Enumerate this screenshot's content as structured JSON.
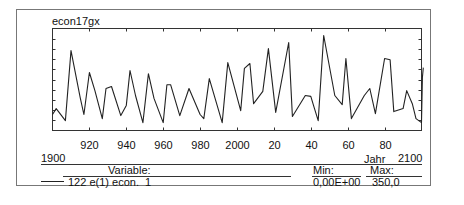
{
  "chart_data": {
    "type": "line",
    "title": "econ17gx",
    "xlabel": "Jahr",
    "ylabel": "",
    "xlim": [
      1900,
      2100
    ],
    "ylim": [
      0,
      350
    ],
    "x_tick_labels": [
      "920",
      "940",
      "960",
      "980",
      "2000",
      "20",
      "40",
      "60",
      "80"
    ],
    "x_ticks": [
      1920,
      1940,
      1960,
      1980,
      2000,
      2020,
      2040,
      2060,
      2080
    ],
    "x_range_labels": {
      "start": "1900",
      "end": "2100",
      "unit": "Jahr"
    },
    "grid": false,
    "series": [
      {
        "name": "122 e(1) econ.  1",
        "x": [
          1900,
          1902,
          1907,
          1910,
          1915,
          1917,
          1920,
          1923,
          1927,
          1929,
          1932,
          1937,
          1940,
          1942,
          1945,
          1949,
          1952,
          1955,
          1960,
          1962,
          1964,
          1969,
          1974,
          1980,
          1982,
          1985,
          1992,
          1995,
          2002,
          2004,
          2007,
          2009,
          2014,
          2017,
          2021,
          2028,
          2030,
          2037,
          2040,
          2042,
          2044,
          2047,
          2053,
          2057,
          2059,
          2062,
          2069,
          2072,
          2075,
          2080,
          2083,
          2085,
          2090,
          2092,
          2095,
          2097,
          2100,
          2100.5,
          2101
        ],
        "values": [
          55,
          75,
          34,
          274,
          113,
          55,
          199,
          137,
          41,
          144,
          151,
          51,
          86,
          206,
          120,
          27,
          195,
          110,
          27,
          157,
          157,
          51,
          144,
          55,
          41,
          178,
          27,
          233,
          68,
          213,
          230,
          92,
          134,
          281,
          62,
          302,
          48,
          120,
          117,
          75,
          34,
          326,
          120,
          89,
          247,
          41,
          120,
          144,
          58,
          247,
          243,
          65,
          75,
          137,
          92,
          41,
          27,
          182,
          216
        ]
      }
    ],
    "legend": {
      "header_variable": "Variable:",
      "header_min": "Min:",
      "header_max": "Max:",
      "entries": [
        {
          "label": "122 e(1) econ.  1",
          "min": "0,00E+00",
          "max": "350,0",
          "color": "#222222"
        }
      ]
    }
  },
  "colors": {
    "line": "#222222",
    "frame": "#333333",
    "outer_border": "#777777"
  }
}
